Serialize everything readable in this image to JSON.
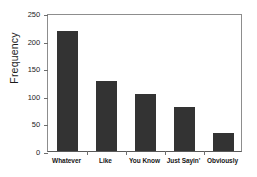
{
  "chart_data": {
    "type": "bar",
    "title": "",
    "xlabel": "",
    "ylabel": "Frequency",
    "categories": [
      "Whatever",
      "Like",
      "You Know",
      "Just Sayin'",
      "Obviously"
    ],
    "values": [
      218,
      126,
      103,
      79,
      33
    ],
    "ylim": [
      0,
      250
    ],
    "yticks": [
      0,
      50,
      100,
      150,
      200,
      250
    ],
    "ytick_labels": [
      "0",
      "50",
      "100",
      "150",
      "200",
      "250"
    ],
    "grid": false,
    "legend": null,
    "bar_color": "#333333",
    "axis_color": "#8d8d8d",
    "background_color": "#ffffff"
  }
}
